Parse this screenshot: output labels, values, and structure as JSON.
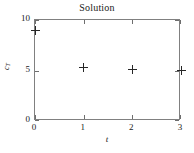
{
  "chart_data": {
    "type": "scatter",
    "title": "Solution",
    "xlabel": "t",
    "ylabel": "c_T",
    "ylabel_base": "c",
    "ylabel_sub": "T",
    "xlim": [
      0,
      3
    ],
    "ylim": [
      0,
      10
    ],
    "xticks": [
      0,
      1,
      2,
      3
    ],
    "xtick_labels": [
      "0",
      "1",
      "2",
      "3"
    ],
    "yticks": [
      0,
      5,
      10
    ],
    "ytick_labels": [
      "0",
      "5",
      "10"
    ],
    "grid": false,
    "legend": null,
    "marker": "plus",
    "series": [
      {
        "name": "c_T",
        "x": [
          0,
          1,
          2,
          3
        ],
        "y": [
          9.0,
          5.3,
          5.05,
          5.0
        ],
        "points": [
          {
            "x": 0,
            "y": 9.0
          },
          {
            "x": 1,
            "y": 5.3
          },
          {
            "x": 2,
            "y": 5.05
          },
          {
            "x": 3,
            "y": 5.0
          }
        ]
      }
    ],
    "colors": {
      "marker": "#262626",
      "frame": "#808080",
      "text": "#1a1a1a",
      "background": "#ffffff"
    }
  }
}
